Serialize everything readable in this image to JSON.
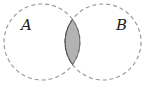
{
  "diagram": {
    "type": "venn",
    "sets": [
      {
        "label": "A",
        "cx": 42,
        "cy": 42,
        "r": 38
      },
      {
        "label": "B",
        "cx": 103,
        "cy": 42,
        "r": 38
      }
    ],
    "shaded_region": "A ∩ B",
    "colors": {
      "outline": "#9a9a9a",
      "shade": "#b3b3b3",
      "shade_stroke": "#555555"
    }
  }
}
